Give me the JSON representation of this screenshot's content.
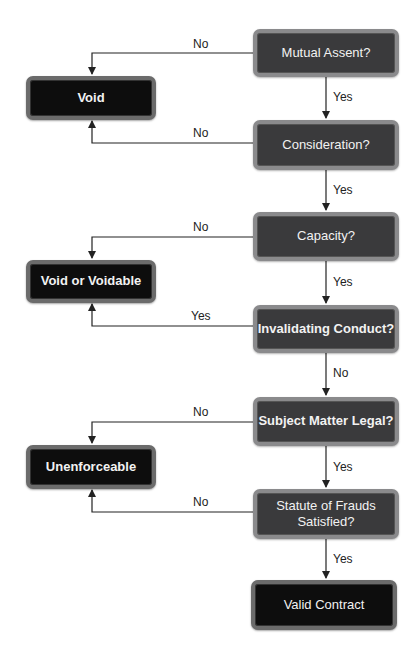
{
  "diagram": {
    "type": "flowchart",
    "decisions": [
      {
        "id": "mutual_assent",
        "label": "Mutual Assent?"
      },
      {
        "id": "consideration",
        "label": "Consideration?"
      },
      {
        "id": "capacity",
        "label": "Capacity?"
      },
      {
        "id": "invalidating_conduct",
        "label": "Invalidating Conduct?"
      },
      {
        "id": "subject_matter_legal",
        "label": "Subject Matter Legal?"
      },
      {
        "id": "statute_of_frauds",
        "label": "Statute of Frauds Satisfied?"
      }
    ],
    "outcomes": [
      {
        "id": "void",
        "label": "Void"
      },
      {
        "id": "void_or_voidable",
        "label": "Void or Voidable"
      },
      {
        "id": "unenforceable",
        "label": "Unenforceable"
      },
      {
        "id": "valid_contract",
        "label": "Valid Contract"
      }
    ],
    "edges": [
      {
        "from": "mutual_assent",
        "to": "void",
        "label": "No"
      },
      {
        "from": "mutual_assent",
        "to": "consideration",
        "label": "Yes"
      },
      {
        "from": "consideration",
        "to": "void",
        "label": "No"
      },
      {
        "from": "consideration",
        "to": "capacity",
        "label": "Yes"
      },
      {
        "from": "capacity",
        "to": "void_or_voidable",
        "label": "No"
      },
      {
        "from": "capacity",
        "to": "invalidating_conduct",
        "label": "Yes"
      },
      {
        "from": "invalidating_conduct",
        "to": "void_or_voidable",
        "label": "Yes"
      },
      {
        "from": "invalidating_conduct",
        "to": "subject_matter_legal",
        "label": "No"
      },
      {
        "from": "subject_matter_legal",
        "to": "unenforceable",
        "label": "No"
      },
      {
        "from": "subject_matter_legal",
        "to": "statute_of_frauds",
        "label": "Yes"
      },
      {
        "from": "statute_of_frauds",
        "to": "unenforceable",
        "label": "No"
      },
      {
        "from": "statute_of_frauds",
        "to": "valid_contract",
        "label": "Yes"
      }
    ]
  },
  "colors": {
    "decision_fill": "#3a3a3c",
    "decision_border": "#8a8a8c",
    "outcome_fill": "#0d0d0d",
    "outcome_border": "#6b6b6b",
    "line": "#222222"
  }
}
